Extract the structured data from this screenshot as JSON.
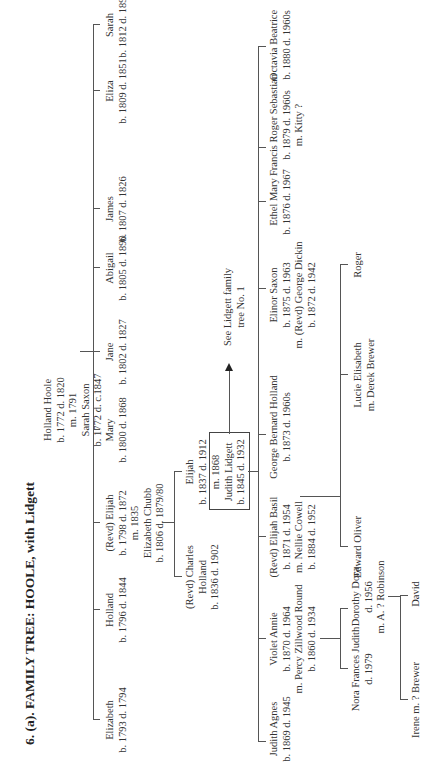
{
  "title": "6. (a). FAMILY TREE: HOOLE, with Lidgett",
  "root": {
    "lines": [
      "Holland Hoole",
      "b. 1772 d. 1820",
      "m. 1791",
      "Sarah Saxon",
      "b. 1772 d. c.1847"
    ]
  },
  "generation1": [
    {
      "name": "Elizabeth",
      "dates": "b. 1793 d. 1794"
    },
    {
      "name": "Holland",
      "dates": "b. 1796 d. 1844"
    },
    {
      "name": "(Revd) Elijah",
      "dates": "b. 1798 d. 1872",
      "marriage": "m. 1835",
      "spouse": "Elizabeth Chubb",
      "spouse_dates": "b. 1806 d. 1879/80"
    },
    {
      "name": "Mary",
      "dates": "b. 1800 d. 1868"
    },
    {
      "name": "Jane",
      "dates": "b. 1802 d. 1827"
    },
    {
      "name": "Abigail",
      "dates": "b. 1805 d. 1890"
    },
    {
      "name": "James",
      "dates": "b. 1807 d. 1826"
    },
    {
      "name": "Eliza",
      "dates": "b. 1809 d. 1851"
    },
    {
      "name": "Sarah",
      "dates": "b. 1812 d. 1894"
    }
  ],
  "generation2": [
    {
      "name": "(Revd) Charles",
      "name2": "Holland",
      "dates": "b. 1836 d. 1902"
    },
    {
      "name": "Elijah",
      "dates": "b. 1837 d. 1912",
      "marriage": "m. 1868",
      "spouse": "Judith Lidgett",
      "spouse_dates": "b. 1845 d. 1932"
    }
  ],
  "cross_reference": {
    "line1": "See Lidgett family",
    "line2": "tree No. 1"
  },
  "generation3": [
    {
      "name": "Judith Agnes",
      "dates": "b. 1869 d. 1945"
    },
    {
      "name": "Violet Annie",
      "dates": "b. 1870 d. 1964",
      "spouse": "m. Percy Zillwood Round",
      "spouse_dates": "b. 1860 d. 1934"
    },
    {
      "name": "(Revd) Elijah Basil",
      "dates": "b. 1871 d. 1954",
      "spouse": "m. Nellie Cowell",
      "spouse_dates": "b. 1884 d. 1952"
    },
    {
      "name": "George Bernard Holland",
      "dates": "b. 1873 d. 1960s"
    },
    {
      "name": "Elinor Saxon",
      "dates": "b. 1875 d. 1963",
      "spouse": "m. (Revd) George Dickin",
      "spouse_dates": "b. 1872 d. 1942"
    },
    {
      "name": "Ethel Mary",
      "dates": "b. 1876 d. 1967"
    },
    {
      "name": "Francis Roger Sebastian",
      "dates": "b. 1879 d. 1960s",
      "spouse": "m. Kitty ?"
    },
    {
      "name": "Octavia Beatrice",
      "dates": "b. 1880 d. 1960s"
    }
  ],
  "generation4": [
    {
      "name": "Nora Frances Judith",
      "dates": "d. 1979"
    },
    {
      "name": "Dorothy Dora",
      "dates": "d. 1956",
      "spouse": "m. A. ? Robinson"
    },
    {
      "name": "Edward Oliver"
    },
    {
      "name": "Lucie Elisabeth",
      "spouse": "m. Derek Brewer"
    },
    {
      "name": "Roger"
    }
  ],
  "generation5": [
    {
      "name": "Irene m. ? Brewer"
    },
    {
      "name": "David"
    }
  ]
}
